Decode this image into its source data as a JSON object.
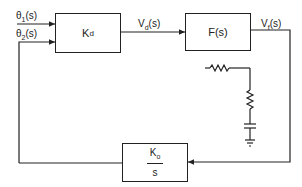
{
  "diagram": {
    "inputs": [
      {
        "label": "θ1(s)",
        "main": "θ",
        "sub": "1",
        "arg": "(s)"
      },
      {
        "label": "θ2(s)",
        "main": "θ",
        "sub": "2",
        "arg": "(s)"
      }
    ],
    "blocks": [
      {
        "id": "phase-detector",
        "main": "K",
        "sub": "d"
      },
      {
        "id": "loop-filter",
        "text": "F(s)"
      },
      {
        "id": "vco",
        "numerator_main": "K",
        "numerator_sub": "o",
        "denominator": "s"
      }
    ],
    "signals": [
      {
        "label": "Vd(s)",
        "main": "V",
        "sub": "d",
        "arg": "(s)"
      },
      {
        "label": "Vf(s)",
        "main": "V",
        "sub": "f",
        "arg": "(s)"
      }
    ],
    "filter_circuit": {
      "components": [
        "series resistor",
        "shunt resistor",
        "capacitor",
        "ground"
      ]
    }
  }
}
